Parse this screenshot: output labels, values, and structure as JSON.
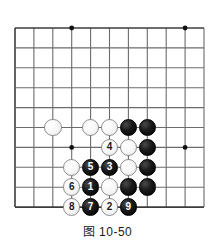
{
  "figure": {
    "caption": "图 10-50",
    "kind": "go-board-diagram"
  },
  "board": {
    "origin_x": 15,
    "origin_y": 28,
    "spacing_x": 18.9,
    "spacing_y": 19.9,
    "cols": 11,
    "rows": 10,
    "line_color": "#6b6b6b",
    "edge_color": "#3c3c3c",
    "background": "#ffffff",
    "star_point_color": "#111111",
    "star_points": [
      {
        "col": 3,
        "row": 0
      },
      {
        "col": 9,
        "row": 0
      },
      {
        "col": 3,
        "row": 6
      },
      {
        "col": 9,
        "row": 6
      }
    ]
  },
  "colors": {
    "black_stone": "#000000",
    "white_stone": "#ffffff",
    "white_stone_border": "#8e8e8e",
    "black_label": "#ffffff",
    "white_label": "#1a1a1a"
  },
  "stones": [
    {
      "col": 2,
      "row": 5,
      "color": "white",
      "label": "",
      "name": "white-stone-c2r5"
    },
    {
      "col": 4,
      "row": 5,
      "color": "white",
      "label": "",
      "name": "white-stone-c4r5"
    },
    {
      "col": 5,
      "row": 5,
      "color": "white",
      "label": "",
      "name": "white-stone-c5r5"
    },
    {
      "col": 6,
      "row": 5,
      "color": "black",
      "label": "",
      "name": "black-stone-c6r5"
    },
    {
      "col": 7,
      "row": 5,
      "color": "black",
      "label": "",
      "name": "black-stone-c7r5"
    },
    {
      "col": 5,
      "row": 6,
      "color": "white",
      "label": "4",
      "name": "white-move-4"
    },
    {
      "col": 6,
      "row": 6,
      "color": "white",
      "label": "",
      "name": "white-stone-c6r6"
    },
    {
      "col": 7,
      "row": 6,
      "color": "black",
      "label": "",
      "name": "black-stone-c7r6"
    },
    {
      "col": 3,
      "row": 7,
      "color": "white",
      "label": "",
      "name": "white-stone-c3r7"
    },
    {
      "col": 4,
      "row": 7,
      "color": "black",
      "label": "5",
      "name": "black-move-5"
    },
    {
      "col": 5,
      "row": 7,
      "color": "black",
      "label": "3",
      "name": "black-move-3"
    },
    {
      "col": 6,
      "row": 7,
      "color": "white",
      "label": "",
      "name": "white-stone-c6r7"
    },
    {
      "col": 7,
      "row": 7,
      "color": "black",
      "label": "",
      "name": "black-stone-c7r7"
    },
    {
      "col": 3,
      "row": 8,
      "color": "white",
      "label": "6",
      "name": "white-move-6"
    },
    {
      "col": 4,
      "row": 8,
      "color": "black",
      "label": "1",
      "name": "black-move-1"
    },
    {
      "col": 5,
      "row": 8,
      "color": "white",
      "label": "",
      "name": "white-stone-c5r8"
    },
    {
      "col": 6,
      "row": 8,
      "color": "black",
      "label": "",
      "name": "black-stone-c6r8"
    },
    {
      "col": 7,
      "row": 8,
      "color": "black",
      "label": "",
      "name": "black-stone-c7r8"
    },
    {
      "col": 3,
      "row": 9,
      "color": "white",
      "label": "8",
      "name": "white-move-8"
    },
    {
      "col": 4,
      "row": 9,
      "color": "black",
      "label": "7",
      "name": "black-move-7"
    },
    {
      "col": 5,
      "row": 9,
      "color": "white",
      "label": "2",
      "name": "white-move-2"
    },
    {
      "col": 6,
      "row": 9,
      "color": "black",
      "label": "9",
      "name": "black-move-9"
    }
  ]
}
